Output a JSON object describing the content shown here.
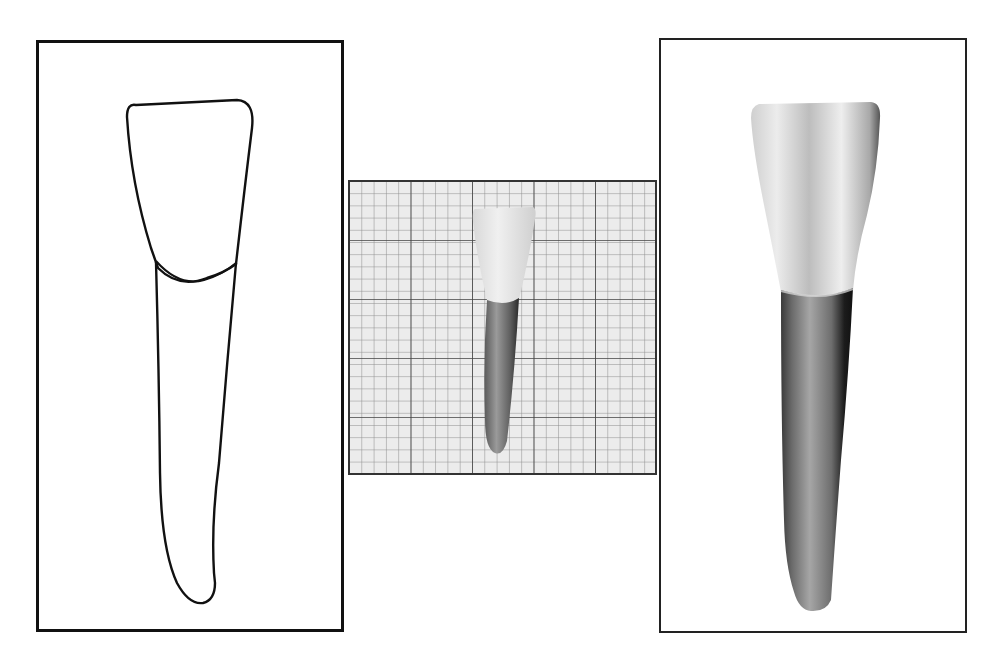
{
  "figure": {
    "panels": [
      {
        "id": "outline-drawing",
        "description": "line drawing outline of tooth crown and root"
      },
      {
        "id": "graph-paper-photo",
        "description": "photograph of tooth on graph paper, actual size"
      },
      {
        "id": "enlarged-photo",
        "description": "enlarged photograph of tooth"
      }
    ]
  },
  "grid": {
    "minor_cells_x": 25,
    "minor_cells_y": 24,
    "major_every": 5
  },
  "colors": {
    "frame": "#111111",
    "grid_minor": "#8a8a8a",
    "grid_major": "#444444",
    "grid_bg": "#ececec",
    "crown": "#e6e6e6",
    "root_dark": "#3a3a3a",
    "root_mid": "#8c8c8c"
  }
}
